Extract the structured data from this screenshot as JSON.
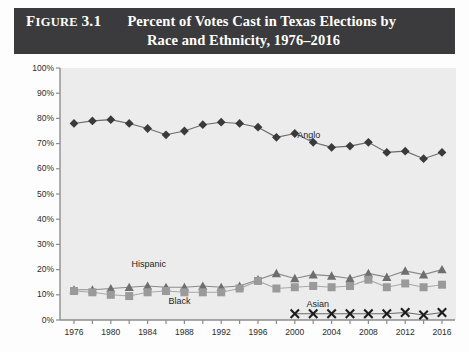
{
  "figure": {
    "label_prefix": "F",
    "label_rest": "IGURE",
    "number": "3.1",
    "title_line_1": "Percent of Votes Cast in Texas Elections by",
    "title_line_2": "Race and Ethnicity, 1976–2016",
    "banner_color": "#3b3b3d",
    "plot_background": "#ececec"
  },
  "chart_data": {
    "type": "line",
    "title": "Percent of Votes Cast in Texas Elections by Race and Ethnicity, 1976–2016",
    "xlabel": "",
    "ylabel": "",
    "ylim": [
      0,
      100
    ],
    "xlim": [
      1976,
      2016
    ],
    "grid": false,
    "legend": "inline-annotations",
    "y_ticks": [
      0,
      10,
      20,
      30,
      40,
      50,
      60,
      70,
      80,
      90,
      100
    ],
    "y_tick_labels": [
      "0%",
      "10%",
      "20%",
      "30%",
      "40%",
      "50%",
      "60%",
      "70%",
      "80%",
      "90%",
      "100%"
    ],
    "x_ticks": [
      1976,
      1978,
      1980,
      1982,
      1984,
      1986,
      1988,
      1990,
      1992,
      1994,
      1996,
      1998,
      2000,
      2002,
      2004,
      2006,
      2008,
      2010,
      2012,
      2014,
      2016
    ],
    "x_tick_labels": [
      "1976",
      "",
      "1980",
      "",
      "1984",
      "",
      "1988",
      "",
      "1992",
      "",
      "1996",
      "",
      "2000",
      "",
      "2004",
      "",
      "2008",
      "",
      "2012",
      "",
      "2016"
    ],
    "x_labeled_years": [
      1976,
      1980,
      1984,
      1988,
      1992,
      1996,
      2000,
      2004,
      2008,
      2012,
      2016
    ],
    "series": [
      {
        "name": "Anglo",
        "marker": "diamond",
        "color": "#3a3a3a",
        "line_color": "#6a6a6a",
        "label_x": 2002,
        "label_y": 73,
        "x": [
          1976,
          1978,
          1980,
          1982,
          1984,
          1986,
          1988,
          1990,
          1992,
          1994,
          1996,
          1998,
          2000,
          2002,
          2004,
          2006,
          2008,
          2010,
          2012,
          2014,
          2016
        ],
        "values": [
          78,
          79,
          79.5,
          78,
          76,
          73.5,
          75,
          77.5,
          78.5,
          78,
          76.5,
          72.5,
          74,
          70.5,
          68.5,
          69,
          70.5,
          66.5,
          67,
          64,
          66.5
        ]
      },
      {
        "name": "Hispanic",
        "marker": "triangle",
        "color": "#6e6e6e",
        "line_color": "#8a8a8a",
        "label_x": 1984,
        "label_y": 22,
        "x": [
          1976,
          1978,
          1980,
          1982,
          1984,
          1986,
          1988,
          1990,
          1992,
          1994,
          1996,
          1998,
          2000,
          2002,
          2004,
          2006,
          2008,
          2010,
          2012,
          2014,
          2016
        ],
        "values": [
          12,
          12,
          12.5,
          13,
          13.5,
          13,
          13,
          13.5,
          13,
          13.5,
          16,
          18.5,
          16.5,
          18,
          17.5,
          16.5,
          18.5,
          17,
          19.5,
          18,
          20
        ]
      },
      {
        "name": "Black",
        "marker": "square",
        "color": "#9a9a9a",
        "line_color": "#a8a8a8",
        "label_x": 1988,
        "label_y": 7,
        "x": [
          1976,
          1978,
          1980,
          1982,
          1984,
          1986,
          1988,
          1990,
          1992,
          1994,
          1996,
          1998,
          2000,
          2002,
          2004,
          2006,
          2008,
          2010,
          2012,
          2014,
          2016
        ],
        "values": [
          11.5,
          11,
          10,
          9.5,
          11,
          11.5,
          11,
          11,
          11,
          12.5,
          15.5,
          12.5,
          13,
          13.5,
          13,
          13.5,
          16,
          13,
          14.5,
          13,
          14
        ]
      },
      {
        "name": "Asian",
        "marker": "x",
        "color": "#1d1d1d",
        "line_color": "#6a6a6a",
        "label_x": 2003,
        "label_y": 6,
        "x": [
          2000,
          2002,
          2004,
          2006,
          2008,
          2010,
          2012,
          2014,
          2016
        ],
        "values": [
          2.5,
          2.5,
          2.5,
          2.5,
          2.5,
          2.5,
          3,
          2,
          3
        ]
      }
    ]
  }
}
